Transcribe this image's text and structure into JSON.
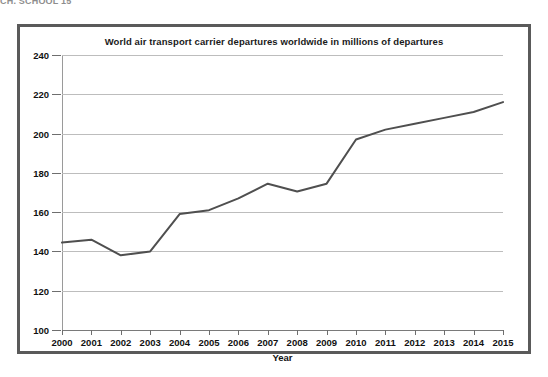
{
  "top_caption": "CH. SCHOOL 15",
  "chart_data": {
    "type": "line",
    "title": "World air transport carrier departures worldwide in millions of departures",
    "xlabel": "Year",
    "ylabel": "",
    "categories": [
      "2000",
      "2001",
      "2002",
      "2003",
      "2004",
      "2005",
      "2006",
      "2007",
      "2008",
      "2009",
      "2010",
      "2011",
      "2012",
      "2013",
      "2014",
      "2015"
    ],
    "values": [
      144.5,
      146,
      138,
      140,
      159,
      161,
      167,
      174.5,
      170.5,
      174.5,
      197,
      202,
      205,
      208,
      211,
      216
    ],
    "series": [
      {
        "name": "Departures (millions)",
        "values": [
          144.5,
          146,
          138,
          140,
          159,
          161,
          167,
          174.5,
          170.5,
          174.5,
          197,
          202,
          205,
          208,
          211,
          216
        ]
      }
    ],
    "ylim": [
      100,
      240
    ],
    "yticks": [
      100,
      120,
      140,
      160,
      180,
      200,
      220,
      240
    ],
    "xlim": [
      "2000",
      "2015"
    ],
    "grid": "horizontal",
    "legend": "none",
    "line_color": "#4f4f4f",
    "grid_color": "#bdbdbd",
    "background_color": "#ffffff",
    "frame_color": "#5a5a5a"
  }
}
